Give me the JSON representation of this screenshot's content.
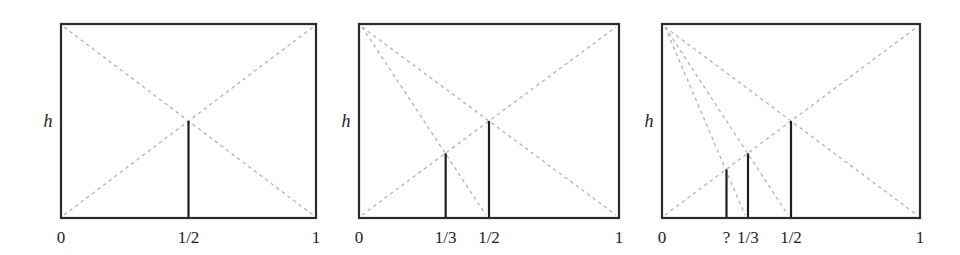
{
  "figure": {
    "colors": {
      "frame": "#2a2a2a",
      "dashed_line": "#b4b4b4",
      "bar": "#1e1e1e",
      "background": "#ffffff"
    },
    "panels": [
      {
        "id": "panel-1",
        "box": {
          "x0": 61,
          "y0": 24,
          "x1": 316,
          "y1": 218
        },
        "y_axis_label": "h",
        "x_labels": [
          {
            "text": "0",
            "x": 0
          },
          {
            "text": "1/2",
            "x": 0.5
          },
          {
            "text": "1",
            "x": 1
          }
        ],
        "dashed_lines": [
          {
            "from": [
              0,
              1
            ],
            "to": [
              1,
              0
            ]
          },
          {
            "from": [
              0,
              0
            ],
            "to": [
              1,
              1
            ]
          }
        ],
        "bars": [
          {
            "x": 0.5,
            "height": 0.5,
            "label": "1/2"
          }
        ]
      },
      {
        "id": "panel-2",
        "box": {
          "x0": 359,
          "y0": 24,
          "x1": 619,
          "y1": 218
        },
        "y_axis_label": "h",
        "x_labels": [
          {
            "text": "0",
            "x": 0
          },
          {
            "text": "1/3",
            "x": 0.3333
          },
          {
            "text": "1/2",
            "x": 0.5
          },
          {
            "text": "1",
            "x": 1
          }
        ],
        "dashed_lines": [
          {
            "from": [
              0,
              1
            ],
            "to": [
              1,
              0
            ]
          },
          {
            "from": [
              0,
              0
            ],
            "to": [
              1,
              1
            ]
          },
          {
            "from": [
              0,
              1
            ],
            "to": [
              0.5,
              0
            ]
          }
        ],
        "bars": [
          {
            "x": 0.3333,
            "height": 0.3333,
            "label": "1/3"
          },
          {
            "x": 0.5,
            "height": 0.5,
            "label": "1/2"
          }
        ]
      },
      {
        "id": "panel-3",
        "box": {
          "x0": 662,
          "y0": 24,
          "x1": 920,
          "y1": 218
        },
        "y_axis_label": "h",
        "x_labels": [
          {
            "text": "0",
            "x": 0
          },
          {
            "text": "?",
            "x": 0.25
          },
          {
            "text": "1/3",
            "x": 0.3333
          },
          {
            "text": "1/2",
            "x": 0.5
          },
          {
            "text": "1",
            "x": 1
          }
        ],
        "dashed_lines": [
          {
            "from": [
              0,
              1
            ],
            "to": [
              1,
              0
            ]
          },
          {
            "from": [
              0,
              0
            ],
            "to": [
              1,
              1
            ]
          },
          {
            "from": [
              0,
              1
            ],
            "to": [
              0.5,
              0
            ]
          },
          {
            "from": [
              0,
              1
            ],
            "to": [
              0.3333,
              0
            ]
          }
        ],
        "bars": [
          {
            "x": 0.25,
            "height": 0.25,
            "label": "?"
          },
          {
            "x": 0.3333,
            "height": 0.3333,
            "label": "1/3"
          },
          {
            "x": 0.5,
            "height": 0.5,
            "label": "1/2"
          }
        ]
      }
    ]
  }
}
